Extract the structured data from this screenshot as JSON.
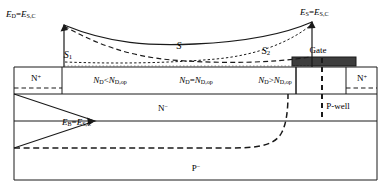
{
  "figure": {
    "type": "semiconductor-device-cross-section",
    "colors": {
      "line": "#1a1a1a",
      "gate_fill": "#3d3d3d",
      "background": "#ffffff"
    }
  },
  "field_labels": {
    "drain_field": "E_D = E_S,C",
    "source_field": "E_S = E_S,C",
    "body_field": "E_B = E_S,C",
    "drain_field_parts": {
      "lhs": "E",
      "lhs_sub": "D",
      "eq": "=",
      "rhs": "E",
      "rhs_sub": "S,C"
    },
    "source_field_parts": {
      "lhs": "E",
      "lhs_sub": "S",
      "eq": "=",
      "rhs": "E",
      "rhs_sub": "S,C"
    },
    "body_field_parts": {
      "lhs": "E",
      "lhs_sub": "B",
      "eq": "=",
      "rhs": "E",
      "rhs_sub": "S,C"
    }
  },
  "curves": {
    "s_label": "S",
    "s1_label": "S1",
    "s2_label": "S2",
    "s1_sub": "1",
    "s2_sub": "2",
    "s_base": "S"
  },
  "doping_labels": [
    {
      "id": "left",
      "text": "N_D < N_D,op",
      "n": "N",
      "n_sub": "D",
      "op": "<",
      "n2": "N",
      "n2_sub": "D,op"
    },
    {
      "id": "middle",
      "text": "N_D = N_D,op",
      "n": "N",
      "n_sub": "D",
      "op": "=",
      "n2": "N",
      "n2_sub": "D,op"
    },
    {
      "id": "right",
      "text": "N_D > N_D,op",
      "n": "N",
      "n_sub": "D",
      "op": ">",
      "n2": "N",
      "n2_sub": "D,op"
    }
  ],
  "regions": {
    "n_plus_left": {
      "base": "N",
      "sup": "+"
    },
    "n_plus_right": {
      "base": "N",
      "sup": "+"
    },
    "n_minus": {
      "base": "N",
      "sup": "−"
    },
    "p_minus": {
      "base": "P",
      "sup": "−"
    },
    "p_well": "P-well",
    "gate": "Gate"
  }
}
